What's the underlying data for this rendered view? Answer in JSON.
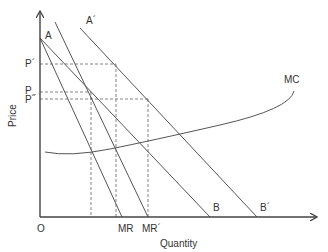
{
  "diagram": {
    "axes": {
      "x_label": "Quantity",
      "y_label": "Price",
      "origin_label": "O"
    },
    "price_labels": [
      {
        "id": "p-prime",
        "text": "P´"
      },
      {
        "id": "p",
        "text": "P"
      },
      {
        "id": "p-double-prime",
        "text": "P˝"
      }
    ],
    "curve_labels": {
      "A": "A",
      "A_prime": "A´",
      "B": "B",
      "B_prime": "B´",
      "MR": "MR",
      "MR_prime": "MR´",
      "MC": "MC"
    },
    "curves": [
      {
        "name": "demand-AB",
        "from": "A",
        "to": "B"
      },
      {
        "name": "marginal-revenue-MR",
        "from": "A",
        "to": "MR"
      },
      {
        "name": "demand-A-prime-B-prime",
        "from": "A´",
        "to": "B´"
      },
      {
        "name": "marginal-revenue-MR-prime",
        "from": "A´",
        "to": "MR´"
      },
      {
        "name": "marginal-cost-MC",
        "shape": "U-shaped, rising"
      }
    ],
    "colors": {
      "line": "#555555",
      "axis": "#444444",
      "text": "#333333"
    }
  }
}
